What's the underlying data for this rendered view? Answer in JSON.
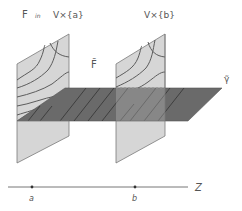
{
  "labels": {
    "F": "F",
    "in": "in",
    "set_a": "V×{a}",
    "set_b": "V×{b}",
    "F_tilde": "F̃",
    "gamma_tilde": "γ̃",
    "axis_z": "Z",
    "point_a": "a",
    "point_b": "b"
  },
  "colors": {
    "vertical_plane_fill": "#d4d4d4",
    "horizontal_plane_fill": "#6a6a6a",
    "contour_stroke": "#5c5c5c",
    "hatch_stroke": "#3e3e3e",
    "axis_stroke": "#777777",
    "text": "#555555"
  }
}
